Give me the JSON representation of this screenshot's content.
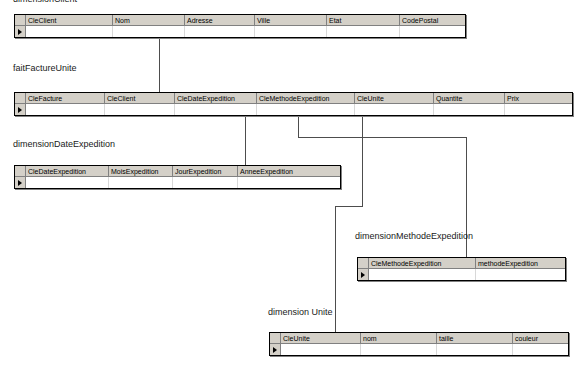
{
  "diagram": {
    "kind": "star-schema-er-diagram",
    "notation": "ms-access-datasheet",
    "line_color": "#4d4d4d",
    "header_fill": "#d4d0c8",
    "border_color": "#000000"
  },
  "tables": [
    {
      "id": "dimensionClient",
      "caption": "dimensionClient",
      "caption_clipped_top": true,
      "columns": [
        "CleClient",
        "Nom",
        "Adresse",
        "Ville",
        "Etat",
        "CodePostal"
      ]
    },
    {
      "id": "faitFactureUnite",
      "caption": "faitFactureUnite",
      "columns": [
        "CleFacture",
        "CleClient",
        "CleDateExpedition",
        "CleMethodeExpedition",
        "CleUnite",
        "Quantite",
        "Prix"
      ]
    },
    {
      "id": "dimensionDateExpedition",
      "caption": "dimensionDateExpedition",
      "columns": [
        "CleDateExpedition",
        "MoisExpedition",
        "JourExpedition",
        "AnneeExpedition"
      ]
    },
    {
      "id": "dimensionMethodeExpedition",
      "caption": "dimensionMethodeExpedition",
      "columns": [
        "CleMethodeExpedition",
        "methodeExpedition"
      ]
    },
    {
      "id": "dimensionUnite",
      "caption": "dimension Unite",
      "columns": [
        "CleUnite",
        "nom",
        "taille",
        "couleur"
      ]
    }
  ],
  "relationships": [
    {
      "from_table": "faitFactureUnite",
      "from_column": "CleClient",
      "to_table": "dimensionClient",
      "to_column": "CleClient",
      "arrow": "left"
    },
    {
      "from_table": "faitFactureUnite",
      "from_column": "CleDateExpedition",
      "to_table": "dimensionDateExpedition",
      "to_column": "CleDateExpedition",
      "arrow": "left"
    },
    {
      "from_table": "faitFactureUnite",
      "from_column": "CleMethodeExpedition",
      "to_table": "dimensionMethodeExpedition",
      "to_column": "CleMethodeExpedition",
      "arrow": "down"
    },
    {
      "from_table": "faitFactureUnite",
      "from_column": "CleUnite",
      "to_table": "dimensionUnite",
      "to_column": "CleUnite",
      "arrow": "down"
    }
  ]
}
